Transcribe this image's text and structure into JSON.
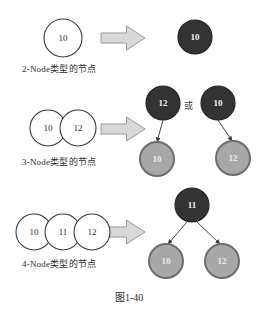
{
  "figure": {
    "caption": "图1-40",
    "colors": {
      "outline_node_fill": "#ffffff",
      "outline_node_stroke": "#3a3a3a",
      "dark_node_fill": "#333333",
      "dark_node_stroke": "#262626",
      "gray_node_fill": "#a8a8a8",
      "gray_node_stroke": "#6e6e6e",
      "arrow_fill": "#d8d8d8",
      "arrow_stroke": "#9a9a9a",
      "edge_stroke": "#4a4a4a",
      "text_dark": "#2b2b2b",
      "text_light": "#f2f2f2",
      "background": "#ffffff"
    }
  },
  "rows": [
    {
      "id": "two-node",
      "label": "2-Node类型的节点",
      "label_pos": {
        "x": 22,
        "y": 62
      },
      "arrow": {
        "x": 101,
        "y": 26,
        "w": 44,
        "h": 24
      },
      "source_nodes": [
        {
          "value": "10",
          "cx": 63,
          "cy": 38,
          "r": 19,
          "style": "outline"
        }
      ],
      "result_nodes": [
        {
          "value": "10",
          "cx": 195,
          "cy": 37,
          "r": 17,
          "style": "dark"
        }
      ],
      "edges": []
    },
    {
      "id": "three-node",
      "label": "3-Node类型的节点",
      "label_pos": {
        "x": 22,
        "y": 155
      },
      "arrow": {
        "x": 101,
        "y": 117,
        "w": 44,
        "h": 24
      },
      "or_label": "或",
      "or_pos": {
        "x": 184,
        "y": 99
      },
      "source_nodes": [
        {
          "value": "10",
          "cx": 48,
          "cy": 128,
          "r": 18,
          "style": "outline"
        },
        {
          "value": "12",
          "cx": 78,
          "cy": 128,
          "r": 18,
          "style": "outline"
        }
      ],
      "result_nodes": [
        {
          "value": "12",
          "cx": 163,
          "cy": 103,
          "r": 17,
          "style": "dark"
        },
        {
          "value": "10",
          "cx": 157,
          "cy": 159,
          "r": 17,
          "style": "gray"
        },
        {
          "value": "10",
          "cx": 218,
          "cy": 103,
          "r": 17,
          "style": "dark"
        },
        {
          "value": "12",
          "cx": 233,
          "cy": 158,
          "r": 17,
          "style": "gray"
        }
      ],
      "edges": [
        {
          "x1": 163,
          "y1": 120,
          "x2": 157,
          "y2": 142
        },
        {
          "x1": 218,
          "y1": 120,
          "x2": 232,
          "y2": 141
        }
      ]
    },
    {
      "id": "four-node",
      "label": "4-Node类型的节点",
      "label_pos": {
        "x": 22,
        "y": 257
      },
      "arrow": {
        "x": 101,
        "y": 220,
        "w": 44,
        "h": 24
      },
      "source_nodes": [
        {
          "value": "10",
          "cx": 34,
          "cy": 232,
          "r": 18,
          "style": "outline"
        },
        {
          "value": "11",
          "cx": 63,
          "cy": 232,
          "r": 18,
          "style": "outline"
        },
        {
          "value": "12",
          "cx": 92,
          "cy": 232,
          "r": 18,
          "style": "outline"
        }
      ],
      "result_nodes": [
        {
          "value": "11",
          "cx": 192,
          "cy": 205,
          "r": 17,
          "style": "dark"
        },
        {
          "value": "10",
          "cx": 166,
          "cy": 261,
          "r": 17,
          "style": "gray"
        },
        {
          "value": "12",
          "cx": 222,
          "cy": 261,
          "r": 17,
          "style": "gray"
        }
      ],
      "edges": [
        {
          "x1": 187,
          "y1": 222,
          "x2": 168,
          "y2": 244
        },
        {
          "x1": 197,
          "y1": 222,
          "x2": 220,
          "y2": 244
        }
      ]
    }
  ],
  "caption_pos": {
    "x": 115,
    "y": 289
  }
}
